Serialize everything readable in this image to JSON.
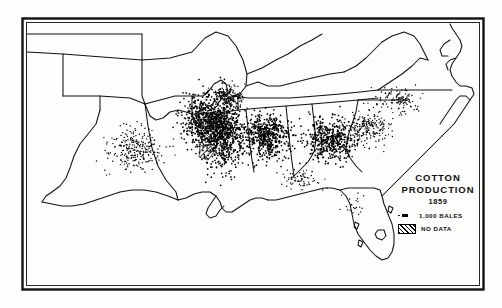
{
  "figure": {
    "kind": "dot-density-map",
    "region": "Southern United States",
    "background_color": "#fdfdfc",
    "ink_color": "#000000",
    "border_color": "#111111"
  },
  "legend": {
    "title_line1": "COTTON",
    "title_line2": "PRODUCTION",
    "year": "1859",
    "entries": [
      {
        "symbol": "dot-equals",
        "label": "1,000 BALES"
      },
      {
        "symbol": "hatch-swatch",
        "label": "NO DATA"
      }
    ]
  },
  "chart_data": {
    "type": "scatter",
    "title": "COTTON PRODUCTION 1859",
    "xlabel": "",
    "ylabel": "",
    "dot_value": 1000,
    "dot_unit": "bales",
    "legend_position": "lower-right",
    "grid": false,
    "series": [
      {
        "name": "Cotton bales (1,000 per dot)",
        "regions": [
          {
            "name": "Mississippi Delta",
            "density": "very-high",
            "cx": 222,
            "cy": 132,
            "rx": 26,
            "ry": 42,
            "dots": 900
          },
          {
            "name": "Alabama Black Belt",
            "density": "very-high",
            "cx": 268,
            "cy": 136,
            "rx": 26,
            "ry": 26,
            "dots": 520
          },
          {
            "name": "Georgia Piedmont",
            "density": "high",
            "cx": 330,
            "cy": 140,
            "rx": 30,
            "ry": 26,
            "dots": 470
          },
          {
            "name": "South Carolina Upcountry",
            "density": "medium",
            "cx": 368,
            "cy": 128,
            "rx": 24,
            "ry": 20,
            "dots": 210
          },
          {
            "name": "Arkansas / Louisiana Valley",
            "density": "high",
            "cx": 200,
            "cy": 120,
            "rx": 22,
            "ry": 30,
            "dots": 330
          },
          {
            "name": "West Tennessee",
            "density": "medium",
            "cx": 228,
            "cy": 96,
            "rx": 20,
            "ry": 14,
            "dots": 170
          },
          {
            "name": "East Texas Blackland",
            "density": "medium",
            "cx": 135,
            "cy": 150,
            "rx": 30,
            "ry": 26,
            "dots": 260
          },
          {
            "name": "North Carolina Coastal Plain",
            "density": "low",
            "cx": 400,
            "cy": 100,
            "rx": 26,
            "ry": 16,
            "dots": 120
          },
          {
            "name": "Florida Panhandle",
            "density": "low",
            "cx": 300,
            "cy": 180,
            "rx": 26,
            "ry": 10,
            "dots": 70
          },
          {
            "name": "Florida Peninsula",
            "density": "very-low",
            "cx": 352,
            "cy": 205,
            "rx": 14,
            "ry": 18,
            "dots": 22
          }
        ]
      }
    ],
    "no_data_areas": [
      {
        "name": "Mississippi unsurveyed tract",
        "cx": 216,
        "cy": 128
      },
      {
        "name": "Louisiana unsurveyed tract",
        "cx": 206,
        "cy": 152
      }
    ]
  }
}
